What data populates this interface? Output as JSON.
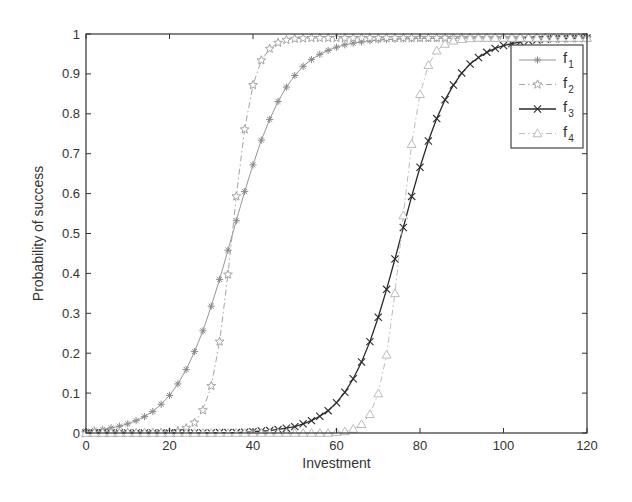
{
  "chart_data": {
    "type": "line",
    "title": "",
    "xlabel": "Investment",
    "ylabel": "Probability of success",
    "xlim": [
      0,
      120
    ],
    "ylim": [
      0,
      1
    ],
    "xticks": [
      0,
      20,
      40,
      60,
      80,
      100,
      120
    ],
    "xtick_labels": [
      "0",
      "20",
      "40",
      "60",
      "80",
      "100",
      "120"
    ],
    "yticks": [
      0,
      0.1,
      0.2,
      0.3,
      0.4,
      0.5,
      0.6,
      0.7,
      0.8,
      0.9,
      1
    ],
    "ytick_labels": [
      "0",
      "0.1",
      "0.2",
      "0.3",
      "0.4",
      "0.5",
      "0.6",
      "0.7",
      "0.8",
      "0.9",
      "1"
    ],
    "grid": false,
    "legend_position": "upper right",
    "x": [
      0,
      2,
      4,
      6,
      8,
      10,
      12,
      14,
      16,
      18,
      20,
      22,
      24,
      26,
      28,
      30,
      32,
      34,
      36,
      38,
      40,
      42,
      44,
      46,
      48,
      50,
      52,
      54,
      56,
      58,
      60,
      62,
      64,
      66,
      68,
      70,
      72,
      74,
      76,
      78,
      80,
      82,
      84,
      86,
      88,
      90,
      92,
      94,
      96,
      98,
      100,
      102,
      104,
      106,
      108,
      110,
      112,
      114,
      116,
      118,
      120
    ],
    "series": [
      {
        "name": "f1",
        "label_base": "f",
        "label_sub": "1",
        "marker": "asterisk",
        "line": "solid",
        "color": "#8a8a8a",
        "values": [
          0.005,
          0.007,
          0.009,
          0.013,
          0.017,
          0.023,
          0.031,
          0.041,
          0.054,
          0.072,
          0.094,
          0.123,
          0.159,
          0.204,
          0.256,
          0.318,
          0.385,
          0.458,
          0.532,
          0.605,
          0.672,
          0.734,
          0.786,
          0.831,
          0.867,
          0.896,
          0.919,
          0.936,
          0.949,
          0.959,
          0.967,
          0.973,
          0.977,
          0.98,
          0.983,
          0.985,
          0.986,
          0.987,
          0.988,
          0.988,
          0.989,
          0.989,
          0.989,
          0.99,
          0.99,
          0.99,
          0.99,
          0.99,
          0.99,
          0.99,
          0.99,
          0.99,
          0.99,
          0.99,
          0.99,
          0.99,
          0.99,
          0.99,
          0.99,
          0.99,
          0.99
        ]
      },
      {
        "name": "f2",
        "label_base": "f",
        "label_sub": "2",
        "marker": "star",
        "line": "dashdot",
        "color": "#9a9a9a",
        "values": [
          0.0,
          0.0,
          0.0,
          0.0,
          0.0,
          0.0,
          0.0,
          0.0,
          0.0,
          0.001,
          0.002,
          0.005,
          0.012,
          0.026,
          0.057,
          0.118,
          0.229,
          0.397,
          0.593,
          0.761,
          0.872,
          0.934,
          0.963,
          0.978,
          0.985,
          0.988,
          0.989,
          0.99,
          0.99,
          0.99,
          0.99,
          0.99,
          0.99,
          0.99,
          0.99,
          0.99,
          0.99,
          0.99,
          0.99,
          0.99,
          0.99,
          0.99,
          0.99,
          0.99,
          0.99,
          0.99,
          0.99,
          0.99,
          0.99,
          0.99,
          0.99,
          0.99,
          0.99,
          0.99,
          0.99,
          0.99,
          0.99,
          0.99,
          0.99,
          0.99,
          0.99
        ]
      },
      {
        "name": "f3",
        "label_base": "f",
        "label_sub": "3",
        "marker": "x",
        "line": "solid",
        "color": "#2a2a2a",
        "values": [
          0.0,
          0.0,
          0.0,
          0.0,
          0.0,
          0.0,
          0.0,
          0.0,
          0.0,
          0.0,
          0.0,
          0.0,
          0.0,
          0.0,
          0.0,
          0.0,
          0.001,
          0.001,
          0.001,
          0.002,
          0.003,
          0.005,
          0.006,
          0.009,
          0.012,
          0.016,
          0.023,
          0.031,
          0.042,
          0.056,
          0.076,
          0.102,
          0.136,
          0.178,
          0.229,
          0.29,
          0.36,
          0.436,
          0.515,
          0.593,
          0.666,
          0.732,
          0.788,
          0.835,
          0.872,
          0.902,
          0.925,
          0.941,
          0.954,
          0.964,
          0.971,
          0.976,
          0.98,
          0.983,
          0.985,
          0.987,
          0.988,
          0.988,
          0.989,
          0.989,
          0.99
        ]
      },
      {
        "name": "f4",
        "label_base": "f",
        "label_sub": "4",
        "marker": "triangle",
        "line": "dashdot",
        "color": "#b4b4b4",
        "values": [
          0.0,
          0.0,
          0.0,
          0.0,
          0.0,
          0.0,
          0.0,
          0.0,
          0.0,
          0.0,
          0.0,
          0.0,
          0.0,
          0.0,
          0.0,
          0.0,
          0.0,
          0.0,
          0.0,
          0.0,
          0.0,
          0.0,
          0.0,
          0.0,
          0.0,
          0.0,
          0.0,
          0.0,
          0.0,
          0.0,
          0.002,
          0.004,
          0.01,
          0.022,
          0.047,
          0.099,
          0.196,
          0.35,
          0.545,
          0.724,
          0.849,
          0.922,
          0.958,
          0.975,
          0.983,
          0.987,
          0.989,
          0.99,
          0.99,
          0.99,
          0.99,
          0.99,
          0.99,
          0.99,
          0.99,
          0.99,
          0.99,
          0.99,
          0.99,
          0.99,
          0.99
        ]
      }
    ]
  },
  "layout": {
    "plot_left": 86,
    "plot_right": 587,
    "plot_top": 34,
    "plot_bottom": 433,
    "legend": {
      "x": 511,
      "y": 45,
      "w": 72,
      "h": 103
    }
  }
}
